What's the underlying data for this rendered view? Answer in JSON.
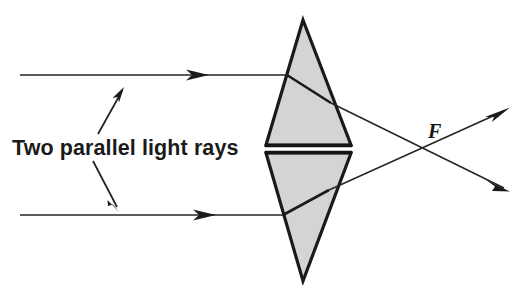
{
  "figure": {
    "background_color": "#ffffff",
    "width": 529,
    "height": 298
  },
  "labels": {
    "rays_label": "Two parallel light rays",
    "focal_point_label": "F"
  },
  "colors": {
    "prism_fill": "#d4d4d4",
    "prism_outline": "#1a1a1a",
    "ray_stroke": "#242424",
    "leader_stroke": "#1f1f1f",
    "text_color": "#1b1b1b",
    "background": "#ffffff"
  },
  "prisms": [
    {
      "name": "upper-prism",
      "orientation": "apex-up",
      "apex": [
        303,
        20
      ],
      "base_left": [
        266,
        145
      ],
      "base_right": [
        351,
        145
      ],
      "fill": "#d4d4d4"
    },
    {
      "name": "lower-prism",
      "orientation": "apex-down",
      "apex": [
        303,
        281
      ],
      "base_left": [
        266,
        153
      ],
      "base_right": [
        351,
        153
      ],
      "fill": "#d4d4d4"
    }
  ],
  "rays": [
    {
      "name": "upper-ray",
      "incoming_start": [
        20,
        75
      ],
      "arrowhead_at": [
        209,
        75
      ],
      "entry_point": [
        287,
        75
      ],
      "exit_point": [
        331,
        103
      ],
      "focal_crossing": [
        437,
        149
      ],
      "outgoing_end": [
        509,
        191
      ],
      "outgoing_arrow": true
    },
    {
      "name": "lower-ray",
      "incoming_start": [
        20,
        215
      ],
      "arrowhead_at": [
        216,
        215
      ],
      "entry_point": [
        283,
        215
      ],
      "exit_point": [
        329,
        190
      ],
      "focal_crossing": [
        437,
        149
      ],
      "outgoing_end": [
        509,
        108
      ],
      "outgoing_arrow": true
    }
  ],
  "focal_point": {
    "name": "focal-point",
    "position": [
      437,
      149
    ],
    "label": "F",
    "label_position": [
      428,
      138
    ]
  },
  "leaders": [
    {
      "name": "upper-leader",
      "from": [
        98,
        134
      ],
      "to": [
        124,
        88
      ],
      "arrow_at_end": true
    },
    {
      "name": "lower-leader",
      "from": [
        93,
        161
      ],
      "to": [
        119,
        211
      ],
      "arrow_at_end": true
    }
  ],
  "text_label_position": {
    "x": 12,
    "y": 155
  }
}
